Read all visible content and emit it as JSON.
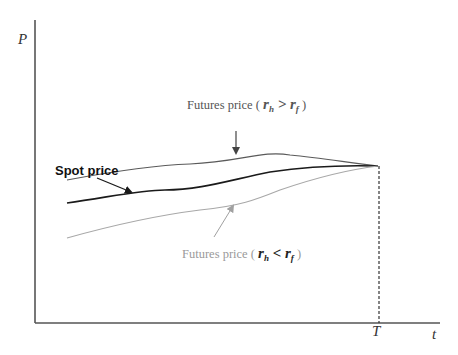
{
  "diagram": {
    "axes": {
      "y_label": "P",
      "x_label": "t",
      "maturity_label": "T"
    },
    "curves": [
      {
        "name": "futures-price-rh-gt-rf",
        "color": "#5a5a5a"
      },
      {
        "name": "spot-price",
        "color": "#1a1a1a"
      },
      {
        "name": "futures-price-rh-lt-rf",
        "color": "#a8a8a8"
      }
    ],
    "labels": {
      "spot": "Spot price",
      "futures_hi_prefix": "Futures price ( ",
      "futures_hi_r1": "r",
      "futures_hi_r1_sub": "h",
      "futures_hi_op": " > ",
      "futures_hi_r2": "r",
      "futures_hi_r2_sub": "f",
      "futures_hi_suffix": " )",
      "futures_lo_prefix": "Futures price ( ",
      "futures_lo_r1": "r",
      "futures_lo_r1_sub": "h",
      "futures_lo_op": " < ",
      "futures_lo_r2": "r",
      "futures_lo_r2_sub": "f",
      "futures_lo_suffix": " )"
    }
  }
}
